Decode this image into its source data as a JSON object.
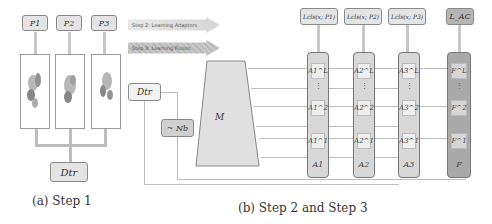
{
  "step1": {
    "outputs": [
      "P1",
      "P2",
      "P3"
    ],
    "input": "Dtr",
    "caption": "(a) Step 1"
  },
  "step2_3": {
    "banners": [
      {
        "label": "Step 2: Learning Adaptors"
      },
      {
        "label": "Step 3: Learning Fusion"
      }
    ],
    "input": "Dtr",
    "noise": "~ Nb",
    "model": "M",
    "losses": [
      "Lcls(x; P1)",
      "Lcls(x; P2)",
      "Lcls(x; P3)"
    ],
    "ac_loss": "L_AC",
    "adaptors": [
      {
        "top": "A1^L",
        "mid": "A1^2",
        "low": "A1^1",
        "foot": "A1"
      },
      {
        "top": "A2^L",
        "mid": "A2^2",
        "low": "A2^1",
        "foot": "A2"
      },
      {
        "top": "A3^L",
        "mid": "A3^2",
        "low": "A3^1",
        "foot": "A3"
      }
    ],
    "fusion": {
      "top": "F^L",
      "mid": "F^2",
      "low": "F^1",
      "foot": "F"
    },
    "dots": "⋮",
    "caption": "(b) Step 2 and Step 3"
  },
  "colors": {
    "box_fill": "#e4e4e4",
    "adaptor_fill": "#d8d8d8",
    "fusion_fill": "#a9a9a9",
    "line": "#bdbdbd",
    "arrow": "#c8c8c8"
  }
}
